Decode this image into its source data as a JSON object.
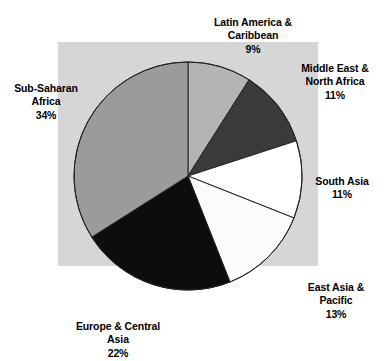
{
  "chart_data": {
    "type": "pie",
    "title": "",
    "subtitle": "",
    "xlabel": "",
    "ylabel": "",
    "legend_position": "outside-labels",
    "grid": false,
    "start_angle_deg": 0,
    "direction": "clockwise",
    "categories": [
      "Latin America & Caribbean",
      "Middle East & North Africa",
      "South Asia",
      "East Asia & Pacific",
      "Europe & Central Asia",
      "Sub-Saharan Africa"
    ],
    "values": [
      9,
      11,
      11,
      13,
      22,
      34
    ],
    "value_unit": "%",
    "slices": [
      {
        "id": "latin-america-caribbean",
        "label": "Latin America &\nCaribbean",
        "percent_text": "9%",
        "value": 9,
        "color": "#b4b4b4",
        "stroke": "#222222"
      },
      {
        "id": "middle-east-north-africa",
        "label": "Middle East &\nNorth Africa",
        "percent_text": "11%",
        "value": 11,
        "color": "#3b3b3b",
        "stroke": "#222222"
      },
      {
        "id": "south-asia",
        "label": "South Asia",
        "percent_text": "11%",
        "value": 11,
        "color": "#ffffff",
        "stroke": "#222222"
      },
      {
        "id": "east-asia-pacific",
        "label": "East Asia &\nPacific",
        "percent_text": "13%",
        "value": 13,
        "color": "#fbfbfb",
        "stroke": "#222222"
      },
      {
        "id": "europe-central-asia",
        "label": "Europe & Central\nAsia",
        "percent_text": "22%",
        "value": 22,
        "color": "#0d0d0d",
        "stroke": "#222222"
      },
      {
        "id": "sub-saharan-africa",
        "label": "Sub-Saharan\nAfrica",
        "percent_text": "34%",
        "value": 34,
        "color": "#9b9b9b",
        "stroke": "#222222"
      }
    ],
    "colors": {
      "panel_background": "#d6d6d6",
      "page_background": "#ffffff",
      "outline": "#222222",
      "text": "#000000"
    }
  }
}
